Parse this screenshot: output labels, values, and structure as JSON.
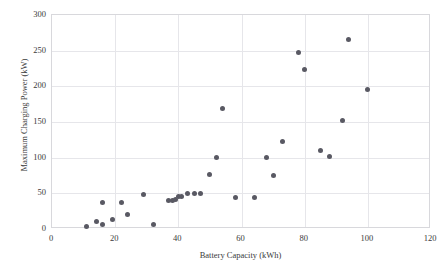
{
  "chart_data": {
    "type": "scatter",
    "title": "",
    "xlabel": "Battery Capacity (kWh)",
    "ylabel": "Maximum Charging Power (kW)",
    "xlim": [
      0,
      120
    ],
    "ylim": [
      0,
      300
    ],
    "xticks": [
      0,
      20,
      40,
      60,
      80,
      100,
      120
    ],
    "yticks": [
      0,
      50,
      100,
      150,
      200,
      250,
      300
    ],
    "grid": true,
    "legend": "none",
    "marker_color": "#595963",
    "gridline_color": "#e6e6ea",
    "axis_color": "#d8d8dc",
    "series": [
      {
        "name": "vehicles",
        "points": [
          [
            11,
            3
          ],
          [
            14,
            11
          ],
          [
            16,
            6
          ],
          [
            16,
            37
          ],
          [
            19,
            14
          ],
          [
            22,
            37
          ],
          [
            24,
            21
          ],
          [
            29,
            49
          ],
          [
            32,
            6
          ],
          [
            37,
            40
          ],
          [
            38,
            40
          ],
          [
            39,
            42
          ],
          [
            40,
            45
          ],
          [
            41,
            46
          ],
          [
            43,
            50
          ],
          [
            45,
            50
          ],
          [
            47,
            50
          ],
          [
            50,
            77
          ],
          [
            52,
            100
          ],
          [
            54,
            169
          ],
          [
            58,
            44
          ],
          [
            64,
            44
          ],
          [
            68,
            100
          ],
          [
            70,
            75
          ],
          [
            73,
            122
          ],
          [
            78,
            248
          ],
          [
            80,
            224
          ],
          [
            85,
            110
          ],
          [
            88,
            101
          ],
          [
            92,
            152
          ],
          [
            94,
            266
          ],
          [
            100,
            196
          ]
        ]
      }
    ]
  }
}
